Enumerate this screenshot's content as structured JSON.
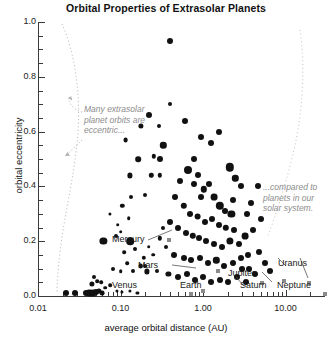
{
  "chart_data": {
    "type": "scatter",
    "title": "Orbital Properties of Extrasolar Planets",
    "xlabel": "average orbital distance (AU)",
    "ylabel": "orbital eccentricity",
    "xscale": "log",
    "xlim": [
      0.01,
      30
    ],
    "ylim": [
      0.0,
      1.0
    ],
    "grid": false,
    "legend": "none",
    "xticks": [
      {
        "value": 0.01,
        "label": "0.01"
      },
      {
        "value": 0.1,
        "label": "0.10"
      },
      {
        "value": 1.0,
        "label": "1.00"
      },
      {
        "value": 10.0,
        "label": "10.00"
      }
    ],
    "yticks": [
      {
        "value": 0.0,
        "label": "0.0"
      },
      {
        "value": 0.2,
        "label": "0.2"
      },
      {
        "value": 0.4,
        "label": "0.4"
      },
      {
        "value": 0.6,
        "label": "0.6"
      },
      {
        "value": 0.8,
        "label": "0.8"
      },
      {
        "value": 1.0,
        "label": "1.0"
      }
    ],
    "yminor_step": 0.05,
    "series": [
      {
        "name": "extrasolar planets",
        "marker": "filled-circle",
        "color": "#111111",
        "points": [
          [
            0.4,
            0.93,
            3.0
          ],
          [
            0.22,
            0.66,
            3.0
          ],
          [
            0.4,
            0.7,
            2.0
          ],
          [
            0.6,
            0.64,
            3.0
          ],
          [
            0.33,
            0.55,
            3.2
          ],
          [
            0.3,
            0.5,
            3.0
          ],
          [
            0.95,
            0.58,
            3.0
          ],
          [
            1.25,
            0.56,
            3.0
          ],
          [
            1.55,
            0.6,
            3.0
          ],
          [
            0.77,
            0.5,
            3.0
          ],
          [
            2.1,
            0.47,
            4.2
          ],
          [
            2.45,
            0.43,
            3.2
          ],
          [
            2.9,
            0.4,
            3.0
          ],
          [
            2.3,
            0.35,
            3.0
          ],
          [
            3.4,
            0.3,
            3.0
          ],
          [
            0.13,
            0.44,
            2.6
          ],
          [
            0.3,
            0.44,
            2.2
          ],
          [
            0.52,
            0.42,
            3.0
          ],
          [
            0.66,
            0.46,
            4.0
          ],
          [
            0.78,
            0.41,
            3.0
          ],
          [
            0.88,
            0.44,
            3.0
          ],
          [
            1.02,
            0.39,
            3.2
          ],
          [
            1.18,
            0.41,
            3.0
          ],
          [
            0.95,
            0.36,
            3.0
          ],
          [
            1.35,
            0.36,
            3.4
          ],
          [
            1.6,
            0.33,
            4.2
          ],
          [
            1.85,
            0.31,
            3.0
          ],
          [
            2.2,
            0.3,
            3.6
          ],
          [
            0.46,
            0.36,
            3.0
          ],
          [
            0.58,
            0.33,
            3.2
          ],
          [
            0.7,
            0.3,
            3.0
          ],
          [
            0.86,
            0.29,
            3.4
          ],
          [
            1.05,
            0.27,
            3.0
          ],
          [
            1.3,
            0.28,
            3.0
          ],
          [
            1.55,
            0.26,
            3.0
          ],
          [
            1.9,
            0.25,
            3.2
          ],
          [
            2.4,
            0.24,
            3.0
          ],
          [
            0.4,
            0.27,
            3.0
          ],
          [
            0.5,
            0.25,
            3.0
          ],
          [
            0.62,
            0.23,
            3.0
          ],
          [
            0.75,
            0.22,
            3.2
          ],
          [
            0.9,
            0.21,
            3.0
          ],
          [
            1.1,
            0.2,
            3.0
          ],
          [
            1.35,
            0.19,
            3.0
          ],
          [
            1.7,
            0.18,
            3.0
          ],
          [
            2.1,
            0.2,
            3.6
          ],
          [
            2.7,
            0.19,
            3.0
          ],
          [
            3.2,
            0.22,
            3.4
          ],
          [
            0.3,
            0.21,
            2.2
          ],
          [
            0.33,
            0.25,
            2.0
          ],
          [
            0.36,
            0.18,
            2.0
          ],
          [
            0.13,
            0.2,
            3.8
          ],
          [
            0.22,
            0.18,
            1.8
          ],
          [
            0.25,
            0.15,
            1.8
          ],
          [
            0.45,
            0.15,
            3.0
          ],
          [
            0.58,
            0.14,
            3.0
          ],
          [
            0.72,
            0.13,
            3.0
          ],
          [
            0.92,
            0.14,
            3.0
          ],
          [
            1.15,
            0.12,
            3.0
          ],
          [
            1.45,
            0.13,
            3.2
          ],
          [
            1.8,
            0.11,
            3.0
          ],
          [
            2.3,
            0.12,
            3.0
          ],
          [
            2.9,
            0.14,
            3.0
          ],
          [
            3.6,
            0.1,
            3.0
          ],
          [
            0.2,
            0.11,
            2.0
          ],
          [
            0.28,
            0.09,
            2.0
          ],
          [
            0.38,
            0.08,
            2.6
          ],
          [
            0.5,
            0.07,
            3.0
          ],
          [
            0.64,
            0.08,
            3.0
          ],
          [
            0.8,
            0.06,
            3.0
          ],
          [
            1.0,
            0.07,
            3.0
          ],
          [
            1.25,
            0.05,
            3.0
          ],
          [
            1.6,
            0.06,
            3.0
          ],
          [
            2.0,
            0.05,
            3.0
          ],
          [
            2.6,
            0.07,
            3.0
          ],
          [
            3.3,
            0.05,
            3.0
          ],
          [
            4.2,
            0.08,
            3.0
          ],
          [
            0.022,
            0.01,
            3.0
          ],
          [
            0.028,
            0.01,
            3.0
          ],
          [
            0.038,
            0.01,
            3.0
          ],
          [
            0.042,
            0.012,
            3.6
          ],
          [
            0.046,
            0.01,
            3.4
          ],
          [
            0.05,
            0.015,
            3.0
          ],
          [
            0.055,
            0.02,
            2.6
          ],
          [
            0.06,
            0.01,
            2.4
          ],
          [
            0.045,
            0.045,
            2.6
          ],
          [
            0.048,
            0.07,
            2.0
          ],
          [
            0.052,
            0.055,
            1.8
          ],
          [
            0.058,
            0.05,
            1.8
          ],
          [
            0.065,
            0.03,
            1.8
          ],
          [
            0.075,
            0.04,
            1.8
          ],
          [
            0.09,
            0.02,
            1.6
          ],
          [
            0.105,
            0.015,
            1.6
          ],
          [
            0.13,
            0.02,
            1.6
          ],
          [
            0.16,
            0.01,
            1.6
          ],
          [
            0.08,
            0.1,
            2.0
          ],
          [
            0.1,
            0.09,
            1.8
          ],
          [
            0.12,
            0.12,
            1.8
          ],
          [
            0.14,
            0.09,
            2.0
          ],
          [
            0.175,
            0.11,
            2.4
          ],
          [
            0.21,
            0.09,
            2.6
          ],
          [
            0.11,
            0.16,
            1.8
          ],
          [
            0.15,
            0.17,
            2.0
          ],
          [
            0.19,
            0.14,
            2.2
          ],
          [
            0.062,
            0.2,
            3.6
          ],
          [
            0.088,
            0.22,
            2.0
          ],
          [
            0.092,
            0.26,
            1.8
          ],
          [
            0.1,
            0.235,
            1.8
          ],
          [
            0.125,
            0.285,
            1.8
          ],
          [
            0.075,
            0.3,
            1.6
          ],
          [
            0.105,
            0.33,
            2.2
          ],
          [
            0.135,
            0.36,
            2.0
          ],
          [
            0.165,
            0.5,
            2.8
          ],
          [
            0.2,
            0.37,
            2.0
          ],
          [
            0.235,
            0.44,
            2.2
          ],
          [
            0.255,
            0.51,
            2.2
          ],
          [
            0.29,
            0.62,
            2.0
          ],
          [
            0.175,
            0.62,
            2.6
          ],
          [
            0.115,
            0.57,
            2.4
          ],
          [
            4.8,
            0.16,
            3.0
          ],
          [
            5.6,
            0.12,
            3.0
          ],
          [
            6.5,
            0.09,
            3.0
          ],
          [
            4.0,
            0.24,
            3.0
          ],
          [
            5.0,
            0.28,
            3.0
          ],
          [
            3.8,
            0.34,
            3.0
          ],
          [
            4.6,
            0.4,
            3.0
          ],
          [
            3.0,
            0.1,
            3.0
          ],
          [
            3.5,
            0.15,
            3.0
          ]
        ]
      },
      {
        "name": "solar system planets",
        "marker": "small-square",
        "color": "#8a8a8a",
        "points": [
          {
            "name": "Mercury",
            "x": 0.387,
            "y": 0.206
          },
          {
            "name": "Venus",
            "x": 0.723,
            "y": 0.007
          },
          {
            "name": "Earth",
            "x": 1.0,
            "y": 0.017
          },
          {
            "name": "Mars",
            "x": 1.524,
            "y": 0.093
          },
          {
            "name": "Jupiter",
            "x": 5.203,
            "y": 0.048
          },
          {
            "name": "Saturn",
            "x": 9.537,
            "y": 0.054
          },
          {
            "name": "Uranus",
            "x": 19.19,
            "y": 0.047
          },
          {
            "name": "Neptune",
            "x": 30.07,
            "y": 0.009
          }
        ]
      }
    ],
    "annotations": [
      {
        "id": "left-note",
        "text": "Many extrasolar planet orbits are eccentric...",
        "style": "italic-gray"
      },
      {
        "id": "right-note",
        "text": "...compared to planets in our solar system.",
        "style": "italic-gray"
      }
    ],
    "planet_labels": [
      {
        "name": "Mercury",
        "label": "Mercury"
      },
      {
        "name": "Venus",
        "label": "Venus"
      },
      {
        "name": "Earth",
        "label": "Earth"
      },
      {
        "name": "Mars",
        "label": "Mars"
      },
      {
        "name": "Jupiter",
        "label": "Jupiter"
      },
      {
        "name": "Saturn",
        "label": "Saturn"
      },
      {
        "name": "Uranus",
        "label": "Uranus"
      },
      {
        "name": "Neptune",
        "label": "Neptune"
      }
    ]
  },
  "colors": {
    "marker": "#111111",
    "solar_marker": "#8a8a8a",
    "axis": "#3a3a3a",
    "annotation": "#8c8c8c",
    "background": "#ffffff"
  }
}
